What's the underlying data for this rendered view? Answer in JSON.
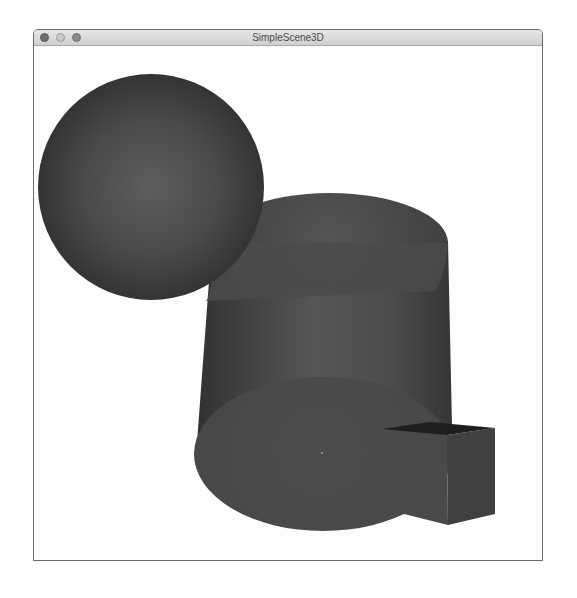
{
  "window": {
    "title": "SimpleScene3D",
    "buttons": {
      "close": "close",
      "minimize": "minimize",
      "zoom": "zoom"
    }
  },
  "scene": {
    "background": "#fdfdfd",
    "objects": [
      {
        "type": "sphere",
        "label": "sphere",
        "color": "#454545",
        "highlight": "#5e5e5e"
      },
      {
        "type": "cylinder",
        "label": "cylinder",
        "color": "#4a4a4a",
        "highlight": "#5c5c5c"
      },
      {
        "type": "box",
        "label": "cube",
        "color": "#484848",
        "top_color": "#1e1e1e"
      }
    ]
  }
}
